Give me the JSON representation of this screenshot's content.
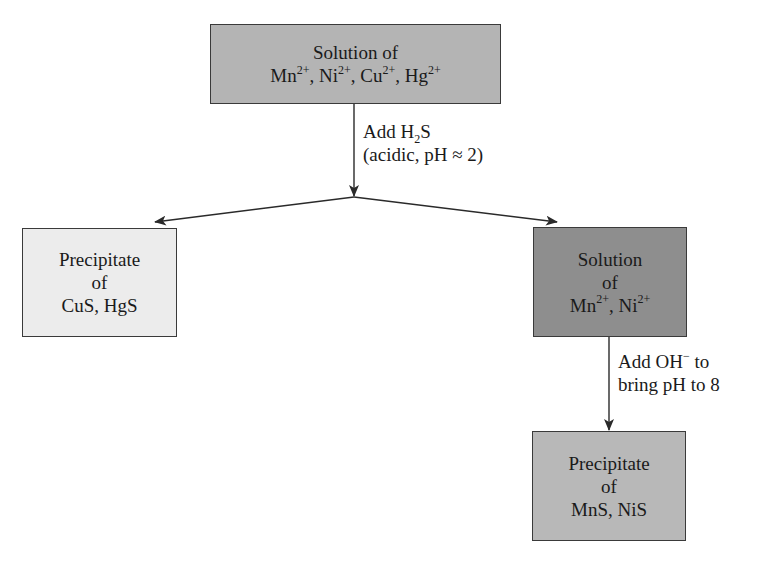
{
  "diagram": {
    "nodes": {
      "start": {
        "title": "Solution of",
        "ions": [
          {
            "symbol": "Mn",
            "charge": "2+"
          },
          {
            "symbol": "Ni",
            "charge": "2+"
          },
          {
            "symbol": "Cu",
            "charge": "2+"
          },
          {
            "symbol": "Hg",
            "charge": "2+"
          }
        ],
        "fill": "#b4b4b4"
      },
      "precip1": {
        "line1": "Precipitate",
        "line2": "of",
        "line3": "CuS, HgS",
        "fill": "#ececec"
      },
      "solution2": {
        "line1": "Solution",
        "line2": "of",
        "ions": [
          {
            "symbol": "Mn",
            "charge": "2+"
          },
          {
            "symbol": "Ni",
            "charge": "2+"
          }
        ],
        "fill": "#8e8e8e"
      },
      "precip2": {
        "line1": "Precipitate",
        "line2": "of",
        "line3": "MnS, NiS",
        "fill": "#b8b8b8"
      }
    },
    "edges": {
      "step1": {
        "line1_prefix": "Add H",
        "line1_sub": "2",
        "line1_suffix": "S",
        "line2": "(acidic, pH ≈ 2)"
      },
      "step2": {
        "line1_prefix": "Add OH",
        "line1_sup": "−",
        "line1_suffix": " to",
        "line2": "bring pH to 8"
      }
    },
    "stroke_color": "#2a2a2a"
  }
}
